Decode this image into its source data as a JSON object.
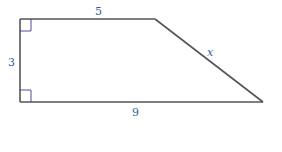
{
  "diagram": {
    "type": "right trapezoid",
    "colors": {
      "edge": "#555555",
      "label": "#3a5a9e",
      "right_angle_marker": "#3a3a8e"
    },
    "vertices": {
      "top_left": [
        20,
        19
      ],
      "top_right": [
        155,
        19
      ],
      "bottom_right": [
        263,
        102
      ],
      "bottom_left": [
        20,
        102
      ]
    },
    "labels": {
      "top": "5",
      "left": "3",
      "slant": "x",
      "bottom": "9"
    },
    "right_angle_markers": [
      "top-left",
      "bottom-left"
    ]
  }
}
